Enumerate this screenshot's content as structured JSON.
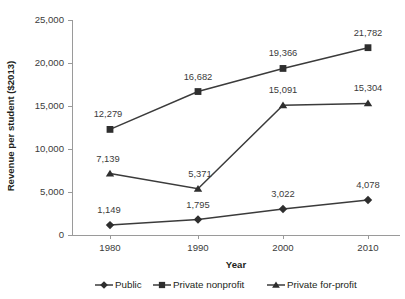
{
  "chart_data": {
    "type": "line",
    "title": "",
    "xlabel": "Year",
    "ylabel": "Revenue per student ($2013)",
    "categories": [
      "1980",
      "1990",
      "2000",
      "2010"
    ],
    "x": [
      1980,
      1990,
      2000,
      2010
    ],
    "ylim": [
      0,
      25000
    ],
    "xlim": [
      1980,
      2010
    ],
    "grid": false,
    "legend_position": "bottom",
    "y_ticks": [
      0,
      5000,
      10000,
      15000,
      20000,
      25000
    ],
    "y_tick_labels": [
      "0",
      "5,000",
      "10,000",
      "15,000",
      "20,000",
      "25,000"
    ],
    "x_tick_labels": [
      "1980",
      "1990",
      "2000",
      "2010"
    ],
    "series": [
      {
        "name": "Public",
        "marker": "diamond",
        "color": "#2e2e2e",
        "values": [
          1149,
          1795,
          3022,
          4078
        ],
        "data_labels": [
          "1,149",
          "1,795",
          "3,022",
          "4,078"
        ]
      },
      {
        "name": "Private nonprofit",
        "marker": "square",
        "color": "#2e2e2e",
        "values": [
          12279,
          16682,
          19366,
          21782
        ],
        "data_labels": [
          "12,279",
          "16,682",
          "19,366",
          "21,782"
        ]
      },
      {
        "name": "Private for-profit",
        "marker": "triangle",
        "color": "#2e2e2e",
        "values": [
          7139,
          5371,
          15091,
          15304
        ],
        "data_labels": [
          "7,139",
          "5,371",
          "15,091",
          "15,304"
        ]
      }
    ]
  },
  "legend": {
    "items": [
      {
        "label": "Public",
        "marker": "diamond"
      },
      {
        "label": "Private nonprofit",
        "marker": "square"
      },
      {
        "label": "Private for-profit",
        "marker": "triangle"
      }
    ]
  },
  "colors": {
    "series": "#2e2e2e",
    "axis": "#9a9a9a",
    "text": "#231f20",
    "background": "#ffffff"
  }
}
